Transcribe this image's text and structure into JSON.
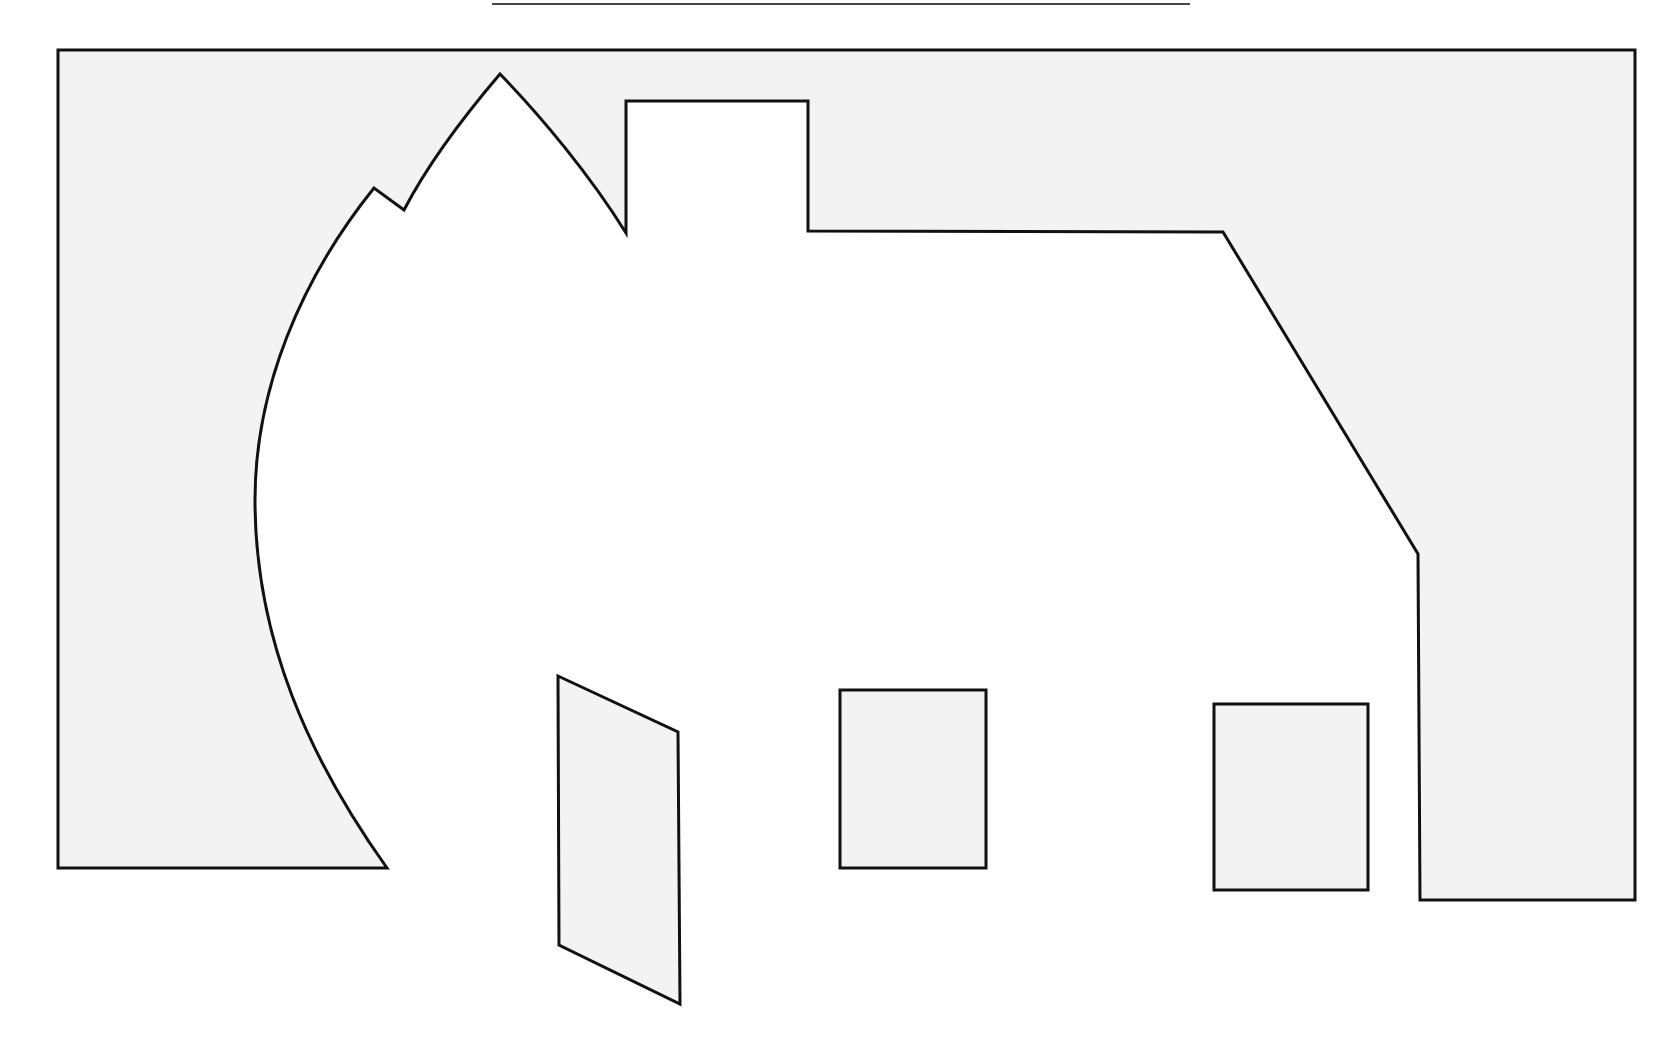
{
  "figure": {
    "colors": {
      "background": "#ffffff",
      "field_fill": "#f3f3f3",
      "stroke": "#111111",
      "rule": "#444444",
      "cutout_fill": "#ffffff",
      "window_fill": "#f3f3f3"
    },
    "stroke_width": 3,
    "top_rule": {
      "x1": 492,
      "x2": 1190,
      "y": 4
    },
    "outer_field": {
      "outline_points": [
        [
          58,
          50
        ],
        [
          1635,
          50
        ],
        [
          1635,
          900
        ],
        [
          1420,
          900
        ],
        [
          1418,
          554
        ],
        [
          1223,
          232
        ],
        [
          808,
          231
        ],
        [
          808,
          101
        ],
        [
          626,
          101
        ],
        [
          626,
          233
        ],
        [
          500,
          74
        ],
        [
          404,
          210
        ],
        [
          374,
          188
        ]
      ],
      "curve_to": [
        255,
        500,
        387,
        868
      ],
      "bottom_left_points": [
        [
          58,
          868
        ]
      ]
    },
    "house": {
      "gable_peak": [
        500,
        74
      ],
      "notch": [
        [
          374,
          188
        ],
        [
          404,
          210
        ]
      ],
      "chimney": {
        "x": 626,
        "y": 101,
        "width": 182,
        "height": 132
      },
      "roof_line_y": 231,
      "right_eave": [
        [
          1223,
          232
        ],
        [
          1418,
          554
        ]
      ],
      "right_wall_x": 1420
    },
    "door": {
      "points": [
        [
          558,
          676
        ],
        [
          678,
          732
        ],
        [
          680,
          1004
        ],
        [
          559,
          945
        ]
      ]
    },
    "windows": [
      {
        "name": "window-left",
        "x": 840,
        "y": 690,
        "width": 146,
        "height": 178
      },
      {
        "name": "window-right",
        "x": 1214,
        "y": 704,
        "width": 154,
        "height": 186
      }
    ]
  }
}
